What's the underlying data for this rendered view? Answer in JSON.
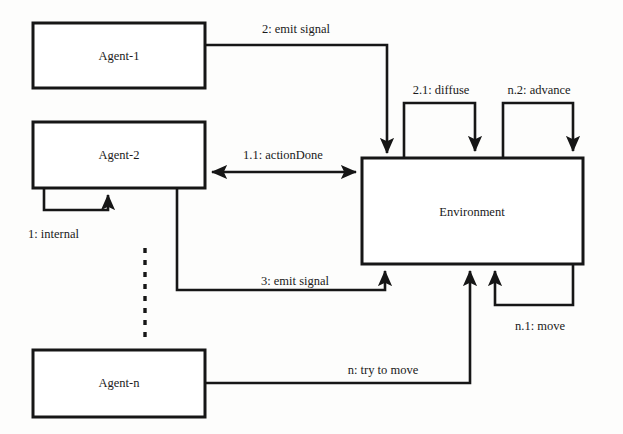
{
  "diagram": {
    "stroke_color": "#161616",
    "background_color": "#fdfdfc",
    "nodes": [
      {
        "id": "agent1",
        "label": "Agent-1"
      },
      {
        "id": "agent2",
        "label": "Agent-2"
      },
      {
        "id": "agentn",
        "label": "Agent-n"
      },
      {
        "id": "environment",
        "label": "Environment"
      }
    ],
    "messages": [
      {
        "id": "m2",
        "label": "2: emit signal",
        "from": "agent1",
        "to": "environment",
        "kind": "directed"
      },
      {
        "id": "m11",
        "label": "1.1: actionDone",
        "from": "agent2",
        "to": "environment",
        "kind": "bidirectional"
      },
      {
        "id": "m1",
        "label": "1: internal",
        "from": "agent2",
        "to": "agent2",
        "kind": "self-loop"
      },
      {
        "id": "m3",
        "label": "3: emit signal",
        "from": "agent2",
        "to": "environment",
        "kind": "directed"
      },
      {
        "id": "mn",
        "label": "n: try to move",
        "from": "agentn",
        "to": "environment",
        "kind": "directed"
      },
      {
        "id": "m21",
        "label": "2.1: diffuse",
        "from": "environment",
        "to": "environment",
        "kind": "self-loop"
      },
      {
        "id": "mn2",
        "label": "n.2: advance",
        "from": "environment",
        "to": "environment",
        "kind": "self-loop"
      },
      {
        "id": "mn1",
        "label": "n.1: move",
        "from": "environment",
        "to": "environment",
        "kind": "self-loop"
      }
    ],
    "ellipsis": {
      "between": [
        "agent2",
        "agentn"
      ],
      "style": "dashed-vertical"
    }
  }
}
